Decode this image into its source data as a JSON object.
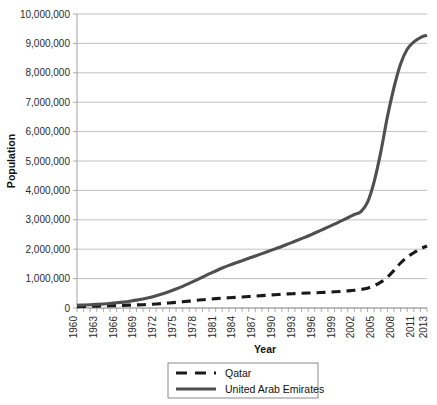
{
  "chart_data": {
    "type": "line",
    "title": "",
    "xlabel": "Year",
    "ylabel": "Population",
    "grid": true,
    "legend_position": "bottom",
    "xlim": [
      1960,
      2013
    ],
    "ylim": [
      0,
      10000000
    ],
    "y_ticks": [
      0,
      1000000,
      2000000,
      3000000,
      4000000,
      5000000,
      6000000,
      7000000,
      8000000,
      9000000,
      10000000
    ],
    "y_tick_labels": [
      "0",
      "1,000,000",
      "2,000,000",
      "3,000,000",
      "4,000,000",
      "5,000,000",
      "6,000,000",
      "7,000,000",
      "8,000,000",
      "9,000,000",
      "10,000,000"
    ],
    "x_tick_labels": [
      "1960",
      "1963",
      "1966",
      "1969",
      "1972",
      "1975",
      "1978",
      "1981",
      "1984",
      "1987",
      "1990",
      "1993",
      "1996",
      "1999",
      "2002",
      "2005",
      "2008",
      "2011",
      "2013"
    ],
    "x_tick_values": [
      1960,
      1963,
      1966,
      1969,
      1972,
      1975,
      1978,
      1981,
      1984,
      1987,
      1990,
      1993,
      1996,
      1999,
      2002,
      2005,
      2008,
      2011,
      2013
    ],
    "x_minor_values": [
      1960,
      1961,
      1962,
      1963,
      1964,
      1965,
      1966,
      1967,
      1968,
      1969,
      1970,
      1971,
      1972,
      1973,
      1974,
      1975,
      1976,
      1977,
      1978,
      1979,
      1980,
      1981,
      1982,
      1983,
      1984,
      1985,
      1986,
      1987,
      1988,
      1989,
      1990,
      1991,
      1992,
      1993,
      1994,
      1995,
      1996,
      1997,
      1998,
      1999,
      2000,
      2001,
      2002,
      2003,
      2004,
      2005,
      2006,
      2007,
      2008,
      2009,
      2010,
      2011,
      2012,
      2013
    ],
    "x": [
      1960,
      1961,
      1962,
      1963,
      1964,
      1965,
      1966,
      1967,
      1968,
      1969,
      1970,
      1971,
      1972,
      1973,
      1974,
      1975,
      1976,
      1977,
      1978,
      1979,
      1980,
      1981,
      1982,
      1983,
      1984,
      1985,
      1986,
      1987,
      1988,
      1989,
      1990,
      1991,
      1992,
      1993,
      1994,
      1995,
      1996,
      1997,
      1998,
      1999,
      2000,
      2001,
      2002,
      2003,
      2004,
      2005,
      2006,
      2007,
      2008,
      2009,
      2010,
      2011,
      2012,
      2013
    ],
    "series": [
      {
        "name": "Qatar",
        "color": "#1a1a1a",
        "style": "dashed",
        "width": 3.1,
        "values": [
          47000,
          52000,
          57000,
          63000,
          69000,
          76000,
          83000,
          90000,
          97000,
          105000,
          112000,
          124000,
          138000,
          154000,
          172000,
          191000,
          212000,
          235000,
          258000,
          280000,
          300000,
          318000,
          334000,
          348000,
          362000,
          376000,
          391000,
          406000,
          422000,
          437000,
          452000,
          466000,
          479000,
          490000,
          500000,
          509000,
          518000,
          528000,
          539000,
          551000,
          565000,
          581000,
          601000,
          630000,
          675000,
          760000,
          880000,
          1050000,
          1280000,
          1530000,
          1740000,
          1880000,
          2010000,
          2110000
        ]
      },
      {
        "name": "United Arab Emirates",
        "color": "#4f4f4f",
        "style": "solid",
        "width": 3.1,
        "values": [
          92000,
          101000,
          112000,
          124000,
          138000,
          155000,
          176000,
          201000,
          231000,
          267000,
          309000,
          359000,
          417000,
          484000,
          560000,
          645000,
          738000,
          838000,
          943000,
          1050000,
          1160000,
          1260000,
          1360000,
          1450000,
          1530000,
          1610000,
          1690000,
          1770000,
          1850000,
          1930000,
          2010000,
          2090000,
          2180000,
          2270000,
          2360000,
          2450000,
          2550000,
          2650000,
          2750000,
          2850000,
          2960000,
          3070000,
          3180000,
          3280000,
          3600000,
          4300000,
          5300000,
          6500000,
          7500000,
          8300000,
          8800000,
          9050000,
          9200000,
          9280000
        ]
      }
    ]
  },
  "legend": {
    "items": [
      {
        "label": "Qatar"
      },
      {
        "label": "United Arab Emirates"
      }
    ]
  }
}
